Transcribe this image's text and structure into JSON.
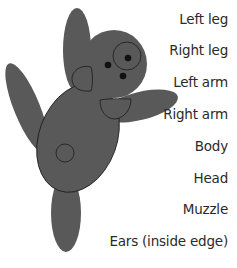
{
  "diagram": {
    "fill_color": "#595959",
    "outline_color": "#1a1a1a",
    "eye_color": "#111111"
  },
  "labels": [
    {
      "text": "Left leg",
      "top": 11
    },
    {
      "text": "Right leg",
      "top": 42
    },
    {
      "text": "Left arm",
      "top": 74
    },
    {
      "text": "Right arm",
      "top": 106
    },
    {
      "text": "Body",
      "top": 138
    },
    {
      "text": "Head",
      "top": 170
    },
    {
      "text": "Muzzle",
      "top": 201
    },
    {
      "text": "Ears (inside edge)",
      "top": 233
    }
  ]
}
